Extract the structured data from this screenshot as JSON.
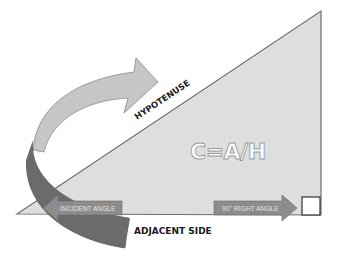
{
  "diagram": {
    "formula": "C=A/H",
    "labels": {
      "hypotenuse": "HYPOTENUSE",
      "adjacent_side": "ADJACENT SIDE",
      "incident_angle": "INCIDENT ANGLE",
      "right_angle": "90° RIGHT ANGLE"
    },
    "colors": {
      "triangle_fill": "#dcdcdc",
      "triangle_stroke": "#6e6e6e",
      "light_arrow": "#c4c4c4",
      "dark_arrow": "#6b6b6b",
      "label_arrow": "#8a8a8a",
      "text": "#1a1a1a"
    }
  }
}
